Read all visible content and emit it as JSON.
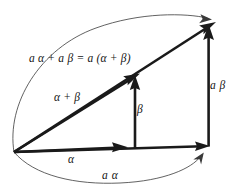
{
  "figure": {
    "background_color": "#ffffff",
    "ink_color": "#1a1a1a",
    "arc_color": "#3a3a3a",
    "width": 239,
    "height": 194
  },
  "labels": {
    "sum_identity": "a α + a β = a (α + β)",
    "alpha_plus_beta": "α + β",
    "beta": "β",
    "a_beta": "a β",
    "alpha": "α",
    "a_alpha": "a α"
  },
  "vectors": [
    {
      "name": "alpha",
      "label": "α",
      "from": [
        14,
        152
      ],
      "to": [
        127,
        147
      ]
    },
    {
      "name": "a-alpha",
      "label": "a α",
      "from": [
        14,
        152
      ],
      "to": [
        209,
        146
      ]
    },
    {
      "name": "beta",
      "label": "β",
      "from": [
        135,
        148
      ],
      "to": [
        135,
        76
      ]
    },
    {
      "name": "a-beta",
      "label": "a β",
      "from": [
        209,
        146
      ],
      "to": [
        209,
        24
      ]
    },
    {
      "name": "alpha-plus-beta",
      "label": "α + β",
      "from": [
        14,
        152
      ],
      "to": [
        139,
        73
      ]
    },
    {
      "name": "a-alpha-plus-beta",
      "label": "a (α + β)",
      "from": [
        14,
        152
      ],
      "to": [
        216,
        22
      ]
    }
  ],
  "arcs": [
    {
      "name": "scaling-arc-upper",
      "from": [
        14,
        152
      ],
      "to": [
        211,
        19
      ],
      "meaning": "scales α+β to a(α+β)"
    },
    {
      "name": "scaling-arc-lower",
      "from": [
        14,
        152
      ],
      "to": [
        203,
        152
      ],
      "meaning": "scales α to aα"
    }
  ]
}
